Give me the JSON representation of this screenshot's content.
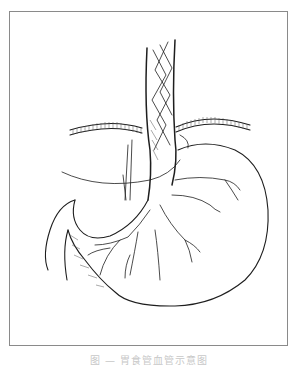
{
  "figure": {
    "style": "black ink line illustration on white",
    "frame_color": "#8a8a8a",
    "ink_color": "#1e1e1e",
    "labels": {
      "diaphragm": "diaphragm",
      "esophagus": "esophagus",
      "stomach": "stomach",
      "vessels": "gastric vessels"
    }
  },
  "caption": {
    "text": "图 — 胃食管血管示意图",
    "visibility": "truncated at bottom edge"
  }
}
